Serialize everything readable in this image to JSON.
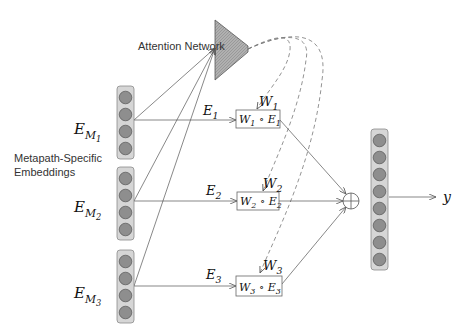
{
  "diagram": {
    "title_labels": {
      "attention_network": "Attention Network",
      "embeddings_line1": "Metapath-Specific",
      "embeddings_line2": "Embeddings"
    },
    "embeddings": [
      {
        "symbol": "E",
        "sub": "M",
        "subsub": "1",
        "circles": 4
      },
      {
        "symbol": "E",
        "sub": "M",
        "subsub": "2",
        "circles": 4
      },
      {
        "symbol": "E",
        "sub": "M",
        "subsub": "3",
        "circles": 4
      }
    ],
    "paths": [
      {
        "edge_label": "E",
        "edge_sub": "1",
        "weight_label": "W",
        "weight_sub": "1",
        "box_text_w": "W",
        "box_sub_w": "1",
        "box_op": "∘",
        "box_text_e": "E",
        "box_sub_e": "1"
      },
      {
        "edge_label": "E",
        "edge_sub": "2",
        "weight_label": "W",
        "weight_sub": "2",
        "box_text_w": "W",
        "box_sub_w": "2",
        "box_op": "∘",
        "box_text_e": "E",
        "box_sub_e": "2"
      },
      {
        "edge_label": "E",
        "edge_sub": "3",
        "weight_label": "W",
        "weight_sub": "3",
        "box_text_w": "W",
        "box_sub_w": "3",
        "box_op": "∘",
        "box_text_e": "E",
        "box_sub_e": "3"
      }
    ],
    "combine_operator": "sum",
    "output": {
      "circles": 8,
      "label": "y"
    },
    "colors": {
      "container_fill": "#d6d6d6",
      "container_stroke": "#8a8a8a",
      "node_fill": "#8e8e8e",
      "node_stroke": "#555555",
      "attention_fill": "#a8a8a8",
      "line": "#555555"
    }
  }
}
